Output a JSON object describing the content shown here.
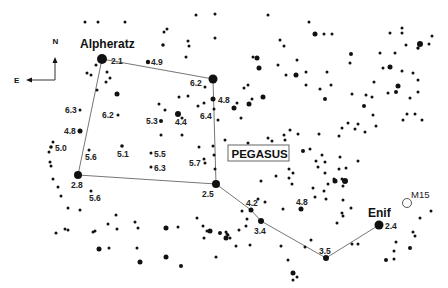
{
  "chart_title": "PEGASUS",
  "compass": {
    "north": "N",
    "east": "E"
  },
  "named_stars": [
    {
      "name": "Alpheratz",
      "mag": "2.1",
      "x": 102,
      "y": 59,
      "r": 5,
      "label_x": 80,
      "label_y": 48,
      "mag_x": 111,
      "mag_y": 64
    },
    {
      "name": "Enif",
      "mag": "2.4",
      "x": 379,
      "y": 225,
      "r": 4.5,
      "label_x": 368,
      "label_y": 217,
      "mag_x": 385,
      "mag_y": 229
    }
  ],
  "labeled_stars": [
    {
      "mag": "4.9",
      "x": 148,
      "y": 62,
      "r": 2.2,
      "lx": 151,
      "ly": 65
    },
    {
      "mag": "6.2",
      "x": 205,
      "y": 87,
      "r": 1.5,
      "lx": 190,
      "ly": 86
    },
    {
      "mag": "4.8",
      "x": 213,
      "y": 99,
      "r": 2.5,
      "lx": 218,
      "ly": 103
    },
    {
      "mag": "6.4",
      "x": 198,
      "y": 106,
      "r": 1.5,
      "lx": 200,
      "ly": 119
    },
    {
      "mag": "5.3",
      "x": 161,
      "y": 121,
      "r": 2,
      "lx": 146,
      "ly": 124
    },
    {
      "mag": "4.4",
      "x": 178,
      "y": 114,
      "r": 3,
      "lx": 175,
      "ly": 125
    },
    {
      "mag": "6.2",
      "x": 118,
      "y": 115,
      "r": 1.5,
      "lx": 102,
      "ly": 118
    },
    {
      "mag": "6.3",
      "x": 80,
      "y": 110,
      "r": 1.5,
      "lx": 65,
      "ly": 113
    },
    {
      "mag": "4.8",
      "x": 80,
      "y": 131,
      "r": 2.5,
      "lx": 64,
      "ly": 134
    },
    {
      "mag": "5.0",
      "x": 51,
      "y": 147,
      "r": 1.8,
      "lx": 55,
      "ly": 151
    },
    {
      "mag": "5.6",
      "x": 89,
      "y": 150,
      "r": 1.5,
      "lx": 85,
      "ly": 160
    },
    {
      "mag": "5.1",
      "x": 122,
      "y": 146,
      "r": 1.8,
      "lx": 117,
      "ly": 157
    },
    {
      "mag": "5.5",
      "x": 151,
      "y": 153,
      "r": 1.5,
      "lx": 154,
      "ly": 157
    },
    {
      "mag": "6.3",
      "x": 151,
      "y": 167,
      "r": 1.5,
      "lx": 154,
      "ly": 171
    },
    {
      "mag": "5.7",
      "x": 205,
      "y": 163,
      "r": 1.5,
      "lx": 189,
      "ly": 166
    },
    {
      "mag": "2.8",
      "x": 78,
      "y": 175,
      "r": 4,
      "lx": 71,
      "ly": 188
    },
    {
      "mag": "5.6",
      "x": 91,
      "y": 191,
      "r": 1.5,
      "lx": 89,
      "ly": 201
    },
    {
      "mag": "2.5",
      "x": 216,
      "y": 184,
      "r": 4,
      "lx": 202,
      "ly": 197
    },
    {
      "mag": "4.2",
      "x": 251,
      "y": 210,
      "r": 2.5,
      "lx": 246,
      "ly": 206
    },
    {
      "mag": "3.4",
      "x": 261,
      "y": 221,
      "r": 3,
      "lx": 254,
      "ly": 234
    },
    {
      "mag": "4.8",
      "x": 301,
      "y": 209,
      "r": 2.5,
      "lx": 296,
      "ly": 205
    },
    {
      "mag": "3.5",
      "x": 326,
      "y": 258,
      "r": 3,
      "lx": 319,
      "ly": 254
    }
  ],
  "cluster": {
    "name": "M15",
    "x": 407,
    "y": 203,
    "r": 4.5,
    "lx": 411,
    "ly": 198
  },
  "asterism_lines": [
    [
      [
        102,
        59
      ],
      [
        213,
        79
      ],
      [
        216,
        184
      ],
      [
        78,
        175
      ],
      [
        102,
        59
      ]
    ],
    [
      [
        216,
        184
      ],
      [
        251,
        210
      ],
      [
        261,
        221
      ],
      [
        326,
        258
      ],
      [
        379,
        225
      ]
    ]
  ],
  "square_corner": {
    "x": 213,
    "y": 79,
    "r": 4.5
  },
  "field_stars": [
    [
      85,
      22,
      1.5
    ],
    [
      98,
      22,
      1.5
    ],
    [
      125,
      22,
      1.5
    ],
    [
      164,
      32,
      1.5
    ],
    [
      167,
      29,
      1.5
    ],
    [
      196,
      15,
      1.5
    ],
    [
      215,
      38,
      1.5
    ],
    [
      215,
      14,
      1.5
    ],
    [
      163,
      45,
      1.8
    ],
    [
      188,
      41,
      1.5
    ],
    [
      189,
      46,
      1.5
    ],
    [
      186,
      57,
      1.5
    ],
    [
      96,
      65,
      1.5
    ],
    [
      87,
      73,
      1.5
    ],
    [
      91,
      75,
      1.5
    ],
    [
      107,
      72,
      1.5
    ],
    [
      110,
      78,
      1.5
    ],
    [
      106,
      82,
      1.5
    ],
    [
      117,
      94,
      2.5
    ],
    [
      97,
      90,
      1.5
    ],
    [
      179,
      97,
      1.5
    ],
    [
      204,
      103,
      1.5
    ],
    [
      188,
      96,
      1.5
    ],
    [
      159,
      104,
      1.5
    ],
    [
      165,
      110,
      1.5
    ],
    [
      182,
      118,
      1.5
    ],
    [
      161,
      135,
      1.5
    ],
    [
      182,
      135,
      1.5
    ],
    [
      199,
      147,
      1.5
    ],
    [
      213,
      146,
      1.5
    ],
    [
      214,
      155,
      1.5
    ],
    [
      215,
      169,
      1.5
    ],
    [
      204,
      159,
      1.5
    ],
    [
      53,
      142,
      1.5
    ],
    [
      49,
      152,
      1.5
    ],
    [
      50,
      162,
      1.5
    ],
    [
      51,
      166,
      1.5
    ],
    [
      53,
      179,
      1.5
    ],
    [
      58,
      187,
      1.5
    ],
    [
      61,
      196,
      1.5
    ],
    [
      68,
      208,
      1.5
    ],
    [
      80,
      210,
      1.5
    ],
    [
      116,
      215,
      1.5
    ],
    [
      135,
      222,
      1.5
    ],
    [
      138,
      228,
      1.5
    ],
    [
      93,
      232,
      1.5
    ],
    [
      108,
      224,
      1.5
    ],
    [
      166,
      228,
      2.5
    ],
    [
      178,
      227,
      1.5
    ],
    [
      56,
      233,
      1.5
    ],
    [
      65,
      229,
      1.5
    ],
    [
      68,
      230,
      1.5
    ],
    [
      95,
      231,
      1.5
    ],
    [
      117,
      229,
      1.5
    ],
    [
      99,
      249,
      2.5
    ],
    [
      109,
      248,
      1.5
    ],
    [
      137,
      248,
      1.5
    ],
    [
      140,
      262,
      2.5
    ],
    [
      166,
      257,
      2.5
    ],
    [
      181,
      266,
      2
    ],
    [
      216,
      257,
      1.5
    ],
    [
      197,
      218,
      1.5
    ],
    [
      203,
      226,
      1.5
    ],
    [
      207,
      231,
      1.5
    ],
    [
      204,
      238,
      1.5
    ],
    [
      210,
      231,
      2.5
    ],
    [
      242,
      211,
      1.5
    ],
    [
      246,
      226,
      1.5
    ],
    [
      247,
      219,
      1.5
    ],
    [
      236,
      246,
      1.5
    ],
    [
      239,
      230,
      1.5
    ],
    [
      230,
      238,
      1.5
    ],
    [
      227,
      234,
      1.5
    ],
    [
      220,
      233,
      2
    ],
    [
      226,
      238,
      2.5
    ],
    [
      250,
      245,
      1.5
    ],
    [
      226,
      232,
      1.5
    ],
    [
      228,
      235,
      1.5
    ],
    [
      283,
      209,
      1.5
    ],
    [
      288,
      260,
      1.5
    ],
    [
      281,
      246,
      1.5
    ],
    [
      305,
      247,
      1.5
    ],
    [
      297,
      277,
      1.5
    ],
    [
      293,
      273,
      2.5
    ],
    [
      293,
      280,
      1.5
    ],
    [
      311,
      240,
      1.5
    ],
    [
      324,
      191,
      1.5
    ],
    [
      343,
      200,
      1.5
    ],
    [
      342,
      213,
      1.5
    ],
    [
      337,
      223,
      1.5
    ],
    [
      351,
      208,
      1.5
    ],
    [
      352,
      244,
      1.5
    ],
    [
      358,
      244,
      1.5
    ],
    [
      225,
      140,
      1.5
    ],
    [
      241,
      118,
      1.5
    ],
    [
      248,
      143,
      1.5
    ],
    [
      245,
      156,
      1.5
    ],
    [
      284,
      135,
      1.5
    ],
    [
      283,
      150,
      1.5
    ],
    [
      289,
      169,
      1.5
    ],
    [
      293,
      173,
      1.5
    ],
    [
      276,
      176,
      1.5
    ],
    [
      290,
      130,
      1.5
    ],
    [
      303,
      151,
      2
    ],
    [
      310,
      149,
      1.5
    ],
    [
      316,
      161,
      1.5
    ],
    [
      292,
      184,
      1.5
    ],
    [
      318,
      167,
      1.5
    ],
    [
      325,
      173,
      1.5
    ],
    [
      326,
      199,
      1.5
    ],
    [
      258,
      199,
      1.5
    ],
    [
      265,
      202,
      1.5
    ],
    [
      315,
      197,
      1.5
    ],
    [
      343,
      186,
      1.5
    ],
    [
      328,
      184,
      1.5
    ],
    [
      334,
      179,
      1.5
    ],
    [
      342,
      179,
      1.5
    ],
    [
      339,
      169,
      1.5
    ],
    [
      346,
      168,
      1.5
    ],
    [
      261,
      181,
      1.5
    ],
    [
      313,
      188,
      1.5
    ],
    [
      339,
      136,
      1.5
    ],
    [
      342,
      128,
      1.5
    ],
    [
      348,
      123,
      1.5
    ],
    [
      319,
      134,
      1.5
    ],
    [
      322,
      155,
      1.5
    ],
    [
      325,
      162,
      1.5
    ],
    [
      340,
      157,
      1.5
    ],
    [
      272,
      141,
      1.5
    ],
    [
      285,
      140,
      1.5
    ],
    [
      298,
      134,
      1.5
    ],
    [
      268,
      138,
      1.5
    ],
    [
      272,
      148,
      1.5
    ],
    [
      261,
      148,
      1.5
    ],
    [
      289,
      178,
      1.5
    ],
    [
      335,
      181,
      2.5
    ],
    [
      345,
      181,
      3
    ],
    [
      343,
      216,
      1.5
    ],
    [
      358,
      161,
      1.5
    ],
    [
      234,
      108,
      2.5
    ],
    [
      214,
      109,
      1.5
    ],
    [
      218,
      120,
      1.5
    ],
    [
      249,
      104,
      2.5
    ],
    [
      237,
      103,
      1.5
    ],
    [
      252,
      99,
      1.5
    ],
    [
      268,
      15,
      1.5
    ],
    [
      309,
      22,
      1.5
    ],
    [
      315,
      34,
      2.5
    ],
    [
      324,
      34,
      1.5
    ],
    [
      332,
      34,
      1.5
    ],
    [
      280,
      40,
      1.5
    ],
    [
      284,
      46,
      1.5
    ],
    [
      257,
      58,
      2.5
    ],
    [
      259,
      68,
      2.5
    ],
    [
      253,
      57,
      1.5
    ],
    [
      278,
      65,
      1.5
    ],
    [
      297,
      60,
      1.5
    ],
    [
      296,
      75,
      2.5
    ],
    [
      306,
      72,
      1.5
    ],
    [
      286,
      75,
      1.5
    ],
    [
      320,
      89,
      1.5
    ],
    [
      325,
      99,
      2
    ],
    [
      327,
      72,
      1.5
    ],
    [
      331,
      85,
      1.5
    ],
    [
      306,
      85,
      1.5
    ],
    [
      244,
      88,
      1.5
    ],
    [
      248,
      85,
      1.5
    ],
    [
      263,
      97,
      2.5
    ],
    [
      351,
      54,
      2
    ],
    [
      350,
      63,
      1.5
    ],
    [
      383,
      68,
      1.5
    ],
    [
      390,
      67,
      2.5
    ],
    [
      380,
      53,
      1.5
    ],
    [
      395,
      53,
      1.5
    ],
    [
      388,
      93,
      1.5
    ],
    [
      396,
      92,
      2
    ],
    [
      402,
      71,
      1.5
    ],
    [
      398,
      86,
      2.5
    ],
    [
      413,
      73,
      1.5
    ],
    [
      372,
      97,
      1.5
    ],
    [
      366,
      95,
      1.5
    ],
    [
      410,
      98,
      1.5
    ],
    [
      418,
      92,
      1.5
    ],
    [
      407,
      114,
      1.5
    ],
    [
      403,
      120,
      1.5
    ],
    [
      390,
      33,
      1.5
    ],
    [
      402,
      33,
      1.5
    ],
    [
      406,
      45,
      1.5
    ],
    [
      420,
      44,
      3
    ],
    [
      418,
      48,
      1.5
    ],
    [
      429,
      44,
      1.5
    ],
    [
      432,
      36,
      1.5
    ],
    [
      402,
      28,
      1.5
    ],
    [
      418,
      48,
      1.5
    ],
    [
      352,
      94,
      1.5
    ],
    [
      364,
      106,
      2
    ],
    [
      358,
      124,
      1.5
    ],
    [
      365,
      132,
      1.5
    ],
    [
      373,
      115,
      1.5
    ],
    [
      376,
      126,
      1.5
    ],
    [
      415,
      114,
      1.5
    ],
    [
      418,
      80,
      1.5
    ],
    [
      422,
      120,
      1.5
    ],
    [
      374,
      82,
      1.5
    ],
    [
      355,
      129,
      1.5
    ],
    [
      431,
      211,
      1.5
    ],
    [
      420,
      218,
      1.5
    ],
    [
      415,
      236,
      1.5
    ],
    [
      410,
      248,
      2
    ],
    [
      413,
      232,
      1.5
    ],
    [
      396,
      242,
      1.5
    ],
    [
      394,
      251,
      1.5
    ],
    [
      386,
      260,
      2
    ],
    [
      394,
      259,
      1.5
    ]
  ]
}
